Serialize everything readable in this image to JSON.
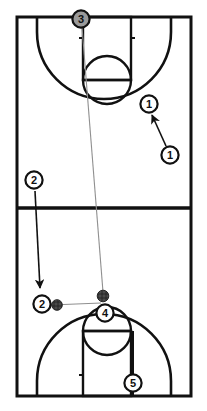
{
  "diagram": {
    "type": "basketball-play-diagram",
    "title": "",
    "orientation": "full-court-vertical",
    "colors": {
      "court_line": "#111111",
      "player_outline": "#111111",
      "player_fill": "#ffffff",
      "player_fill_highlight": "#9a9a9a",
      "ball_fill": "#4a4a4a",
      "pass_line": "#8a8a8a",
      "cut_arrow": "#111111",
      "background": "#ffffff"
    },
    "court": {
      "left": 17,
      "right": 191,
      "top": 17,
      "bottom": 396,
      "halfcourt_y": 208,
      "key_left": 83,
      "key_right": 131,
      "top_freethrow_y": 80,
      "bottom_freethrow_y": 331,
      "freethrow_circle_radius": 24,
      "three_point_inset": 20,
      "line_width_outer": 3,
      "line_width_inner": 2
    },
    "players": [
      {
        "id": "p3",
        "label": "3",
        "x": 81,
        "y": 19,
        "fill": "highlight",
        "r": 9,
        "name": "player-3-token",
        "role": "inbounder-top-baseline"
      },
      {
        "id": "p1a",
        "label": "1",
        "x": 149,
        "y": 104,
        "fill": "white",
        "r": 9,
        "name": "player-1-destination-token",
        "role": "wing-top-half"
      },
      {
        "id": "p1b",
        "label": "1",
        "x": 170,
        "y": 155,
        "fill": "white",
        "r": 9,
        "name": "player-1-origin-token",
        "role": "start-position"
      },
      {
        "id": "p2a",
        "label": "2",
        "x": 34,
        "y": 180,
        "fill": "white",
        "r": 9,
        "name": "player-2-origin-token",
        "role": "start-position"
      },
      {
        "id": "p2b",
        "label": "2",
        "x": 42,
        "y": 304,
        "fill": "white",
        "r": 9,
        "name": "player-2-destination-token",
        "role": "wing-bottom-half"
      },
      {
        "id": "p4",
        "label": "4",
        "x": 105,
        "y": 313,
        "fill": "white",
        "r": 9,
        "name": "player-4-token",
        "role": "top-of-key-bottom-half"
      },
      {
        "id": "p5",
        "label": "5",
        "x": 133,
        "y": 383,
        "fill": "white",
        "r": 9,
        "name": "player-5-token",
        "role": "baseline-bottom"
      }
    ],
    "balls": [
      {
        "id": "b1",
        "x": 57,
        "y": 306,
        "r": 5.5,
        "name": "ball-icon-left"
      },
      {
        "id": "b2",
        "x": 103,
        "y": 296,
        "r": 6.0,
        "name": "ball-icon-key"
      }
    ],
    "pass_lines": [
      {
        "id": "pass-3-to-ball",
        "from": "3",
        "to": "ball-key",
        "x1": 82,
        "y1": 27,
        "x2": 103,
        "y2": 293,
        "name": "pass-line-player3-to-ball"
      },
      {
        "id": "connect-2-to-ball",
        "from": "2",
        "to": "ball-left",
        "x1": 50,
        "y1": 305,
        "x2": 100,
        "y2": 303,
        "name": "pass-line-player2-to-ball"
      }
    ],
    "cut_arrows": [
      {
        "id": "cut-1",
        "from": "1-origin",
        "to": "1-destination",
        "x1": 165,
        "y1": 145,
        "x2": 152,
        "y2": 114,
        "name": "cut-arrow-player-1"
      },
      {
        "id": "cut-2",
        "from": "2-origin",
        "to": "2-destination",
        "x1": 35,
        "y1": 191,
        "x2": 40,
        "y2": 293,
        "name": "cut-arrow-player-2"
      }
    ],
    "connectors": [
      {
        "id": "p5-stem",
        "x1": 133,
        "y1": 374,
        "x2": 133,
        "y2": 396,
        "name": "connector-player-5-baseline"
      },
      {
        "id": "p5-stem-up",
        "x1": 133,
        "y1": 331,
        "x2": 133,
        "y2": 374,
        "name": "connector-player-5-freethrow"
      }
    ],
    "legend": {
      "ball_label": "ball",
      "player_label": "player",
      "pass_label": "pass",
      "cut_label": "cut"
    }
  }
}
